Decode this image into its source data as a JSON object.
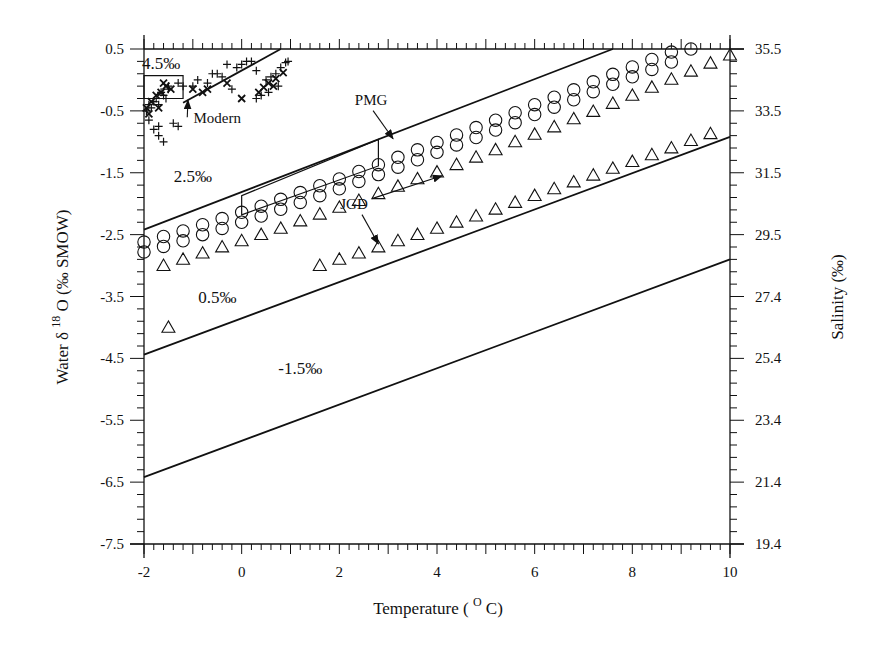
{
  "chart_data": {
    "type": "scatter",
    "title": "",
    "xlabel": "Temperature ( ° C)",
    "xlabel_parts": {
      "pre": "Temperature (",
      "sup": "O",
      "post": "C)"
    },
    "ylabel": "Water δ18O (‰ SMOW)",
    "ylabel_parts": {
      "pre": "Water  δ",
      "sup": "18",
      "post": "O (‰ SMOW)"
    },
    "y2label": "Salinity (‰)",
    "xlim": [
      -2,
      10
    ],
    "ylim": [
      -7.5,
      0.5
    ],
    "x_ticks": [
      "-2",
      "0",
      "2",
      "4",
      "6",
      "8",
      "10"
    ],
    "y_ticks": [
      "0.5",
      "-0.5",
      "-1.5",
      "-2.5",
      "-3.5",
      "-4.5",
      "-5.5",
      "-6.5",
      "-7.5"
    ],
    "y2_ticks": [
      "35.5",
      "33.5",
      "31.5",
      "29.5",
      "27.4",
      "25.4",
      "23.4",
      "21.4",
      "19.4"
    ],
    "grid": false,
    "legend": "none",
    "isolines": [
      {
        "label": "4.5‰",
        "x": [
          -1.2,
          0.8
        ],
        "y": [
          -0.37,
          0.5
        ]
      },
      {
        "label": "2.5‰",
        "x": [
          -2,
          7.6
        ],
        "y": [
          -2.42,
          0.5
        ]
      },
      {
        "label": "0.5‰",
        "x": [
          -2,
          10
        ],
        "y": [
          -4.44,
          -0.92
        ]
      },
      {
        "label": "-1.5‰",
        "x": [
          -2,
          10
        ],
        "y": [
          -6.42,
          -2.9
        ]
      }
    ],
    "series": [
      {
        "name": "PMG (circles)",
        "marker": "circle",
        "x": [
          -2.0,
          -1.6,
          -1.2,
          -0.8,
          -0.4,
          0.0,
          0.4,
          0.8,
          1.2,
          1.6,
          2.0,
          2.4,
          2.8,
          3.2,
          3.6,
          4.0,
          4.4,
          4.8,
          5.2,
          5.6,
          6.0,
          6.4,
          6.8,
          7.2,
          7.6,
          8.0,
          8.4,
          8.8,
          9.2
        ],
        "y_upper": [
          -2.62,
          -2.53,
          -2.44,
          -2.34,
          -2.24,
          -2.14,
          -2.04,
          -1.93,
          -1.82,
          -1.71,
          -1.6,
          -1.48,
          -1.37,
          -1.25,
          -1.13,
          -1.01,
          -0.89,
          -0.77,
          -0.65,
          -0.53,
          -0.4,
          -0.28,
          -0.16,
          -0.03,
          0.09,
          0.21,
          0.33,
          0.45,
          0.5
        ],
        "y_lower": [
          -2.78,
          -2.69,
          -2.6,
          -2.5,
          -2.4,
          -2.3,
          -2.2,
          -2.09,
          -1.98,
          -1.87,
          -1.76,
          -1.64,
          -1.53,
          -1.41,
          -1.29,
          -1.17,
          -1.05,
          -0.93,
          -0.81,
          -0.69,
          -0.56,
          -0.44,
          -0.32,
          -0.19,
          -0.07,
          0.05,
          0.17,
          0.29,
          null
        ]
      },
      {
        "name": "JGD upper (triangles)",
        "marker": "triangle",
        "x": [
          -1.6,
          -1.2,
          -0.8,
          -0.4,
          0.0,
          0.4,
          0.8,
          1.2,
          1.6,
          2.0,
          2.4,
          2.8,
          3.2,
          3.6,
          4.0,
          4.4,
          4.8,
          5.2,
          5.6,
          6.0,
          6.4,
          6.8,
          7.2,
          7.6,
          8.0,
          8.4,
          8.8,
          9.2,
          9.6,
          10.0
        ],
        "y": [
          -3.0,
          -2.9,
          -2.8,
          -2.7,
          -2.6,
          -2.5,
          -2.4,
          -2.28,
          -2.17,
          -2.06,
          -1.95,
          -1.84,
          -1.72,
          -1.6,
          -1.49,
          -1.37,
          -1.25,
          -1.13,
          -1.0,
          -0.88,
          -0.76,
          -0.63,
          -0.51,
          -0.38,
          -0.25,
          -0.12,
          0.01,
          0.14,
          0.27,
          0.4
        ]
      },
      {
        "name": "JGD lower (triangles)",
        "marker": "triangle",
        "x": [
          -1.5,
          1.6,
          2.0,
          2.4,
          2.8,
          3.2,
          3.6,
          4.0,
          4.4,
          4.8,
          5.2,
          5.6,
          6.0,
          6.4,
          6.8,
          7.2,
          7.6,
          8.0,
          8.4,
          8.8,
          9.2,
          9.6
        ],
        "y": [
          -4.0,
          -3.0,
          -2.9,
          -2.8,
          -2.7,
          -2.6,
          -2.5,
          -2.4,
          -2.3,
          -2.2,
          -2.09,
          -1.98,
          -1.87,
          -1.76,
          -1.65,
          -1.54,
          -1.43,
          -1.32,
          -1.21,
          -1.1,
          -0.98,
          -0.87
        ]
      },
      {
        "name": "Modern (plus)",
        "marker": "plus",
        "x": [
          -1.95,
          -1.9,
          -1.85,
          -1.8,
          -1.75,
          -1.7,
          -1.65,
          -1.6,
          -1.55,
          -1.5,
          -1.4,
          -1.3,
          -1.9,
          -1.8,
          -1.7,
          -1.5,
          -1.3,
          -1.2,
          -0.9,
          -0.7,
          -0.5,
          -0.3,
          -0.1,
          0.1,
          0.3,
          0.5,
          0.6,
          0.7,
          0.8,
          0.9,
          0.95,
          -1.6,
          -1.7,
          -0.4,
          0.0,
          0.2,
          0.4,
          -1.0,
          -0.6,
          -0.2,
          0.3,
          0.55,
          0.75
        ],
        "y": [
          -0.5,
          -0.4,
          -0.45,
          -0.35,
          -0.3,
          -0.4,
          -0.2,
          -0.25,
          -0.3,
          -0.1,
          -0.7,
          -0.75,
          -0.65,
          -0.8,
          -0.9,
          -0.15,
          -0.05,
          -0.1,
          0.0,
          -0.05,
          0.1,
          0.25,
          0.2,
          0.3,
          0.15,
          0.0,
          0.05,
          0.1,
          0.2,
          0.28,
          0.3,
          -1.0,
          -0.75,
          0.05,
          0.25,
          0.3,
          -0.25,
          -0.1,
          0.1,
          -0.15,
          -0.3,
          -0.2,
          -0.1
        ]
      },
      {
        "name": "Modern (x)",
        "marker": "x",
        "x": [
          -1.95,
          -1.85,
          -1.75,
          -1.65,
          -1.55,
          -1.45,
          -1.9,
          -1.7,
          -1.6,
          -0.8,
          -1.0,
          -0.7,
          -0.3,
          0.0,
          0.35,
          0.45,
          0.55,
          0.65,
          0.7,
          0.85
        ],
        "y": [
          -0.45,
          -0.35,
          -0.25,
          -0.2,
          -0.1,
          -0.15,
          -0.55,
          -0.45,
          -0.05,
          -0.2,
          -0.15,
          -0.15,
          -0.05,
          -0.3,
          -0.2,
          -0.12,
          -0.05,
          -0.1,
          0.02,
          0.12
        ]
      }
    ],
    "boxes": [
      {
        "name": "modern-box",
        "corners": [
          [
            -2,
            0.07
          ],
          [
            -1.2,
            0.07
          ],
          [
            -1.2,
            -0.3
          ],
          [
            -2,
            -0.3
          ]
        ]
      },
      {
        "name": "pmg-box",
        "corners": [
          [
            0.0,
            -1.87
          ],
          [
            0.0,
            -2.18
          ],
          [
            2.8,
            -1.39
          ],
          [
            2.8,
            -0.96
          ]
        ]
      }
    ],
    "annotations": [
      {
        "text": "4.5‰",
        "x": -1.65,
        "y": 0.18
      },
      {
        "text": "2.5‰",
        "x": -1.0,
        "y": -1.65
      },
      {
        "text": "0.5‰",
        "x": -0.5,
        "y": -3.6
      },
      {
        "text": "-1.5‰",
        "x": 1.2,
        "y": -4.75
      },
      {
        "text": "Modern",
        "x": -0.5,
        "y": -0.7,
        "arrow_to": [
          -1.1,
          -0.33
        ]
      },
      {
        "text": "PMG",
        "x": 2.65,
        "y": -0.4,
        "arrow_to": [
          3.1,
          -0.95
        ]
      },
      {
        "text": "JGD",
        "x": 2.3,
        "y": -2.08,
        "arrow_to": [
          4.1,
          -1.55
        ],
        "arrow2_to": [
          2.8,
          -2.65
        ]
      }
    ]
  }
}
